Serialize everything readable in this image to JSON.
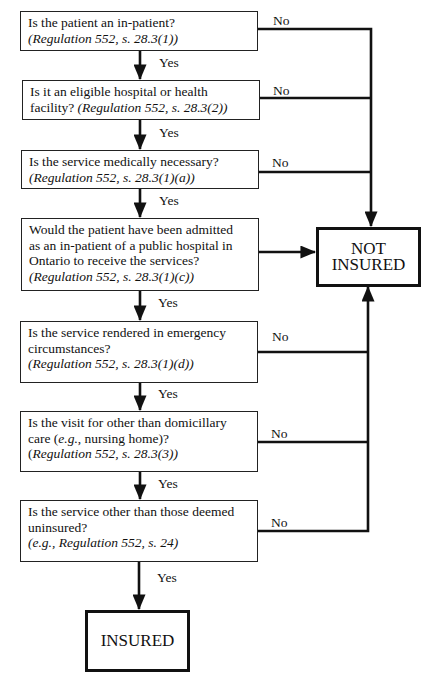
{
  "nodes": [
    {
      "id": "q1",
      "lines": [
        [
          {
            "text": "Is the patient an in-patient?",
            "italic": false
          }
        ],
        [
          {
            "text": "(Regulation 552, s. 28.3(1))",
            "italic": true
          }
        ]
      ]
    },
    {
      "id": "q2",
      "lines": [
        [
          {
            "text": "Is it an eligible hospital or health",
            "italic": false
          }
        ],
        [
          {
            "text": "facility? ",
            "italic": false
          },
          {
            "text": "(Regulation 552, s. 28.3(2))",
            "italic": true
          }
        ]
      ]
    },
    {
      "id": "q3",
      "lines": [
        [
          {
            "text": "Is the service medically necessary?",
            "italic": false
          }
        ],
        [
          {
            "text": "(Regulation 552, s. 28.3(1)(a))",
            "italic": true
          }
        ]
      ]
    },
    {
      "id": "q4",
      "lines": [
        [
          {
            "text": "Would the patient have been admitted",
            "italic": false
          }
        ],
        [
          {
            "text": "as an in-patient of a public hospital in",
            "italic": false
          }
        ],
        [
          {
            "text": "Ontario to receive the services?",
            "italic": false
          }
        ],
        [
          {
            "text": "(Regulation 552, s. 28.3(1)(c))",
            "italic": true
          }
        ]
      ]
    },
    {
      "id": "q5",
      "lines": [
        [
          {
            "text": "Is the service rendered in emergency",
            "italic": false
          }
        ],
        [
          {
            "text": "circumstances?",
            "italic": false
          }
        ],
        [
          {
            "text": "(Regulation 552, s. 28.3(1)(d))",
            "italic": true
          }
        ]
      ]
    },
    {
      "id": "q6",
      "lines": [
        [
          {
            "text": "Is the visit for other than domicillary",
            "italic": false
          }
        ],
        [
          {
            "text": "care (",
            "italic": false
          },
          {
            "text": "e.g.",
            "italic": true
          },
          {
            "text": ", nursing home)?",
            "italic": false
          }
        ],
        [
          {
            "text": "(",
            "italic": false
          },
          {
            "text": "Regulation 552, s. 28.3(3))",
            "italic": true
          }
        ]
      ]
    },
    {
      "id": "q7",
      "lines": [
        [
          {
            "text": "Is the service other than those deemed",
            "italic": false
          }
        ],
        [
          {
            "text": "uninsured?",
            "italic": false
          }
        ],
        [
          {
            "text": "(e.g., Regulation 552, s. 24)",
            "italic": true
          }
        ]
      ]
    }
  ],
  "outcomes": {
    "not_insured": {
      "line1": "NOT",
      "line2": "INSURED"
    },
    "insured": {
      "line1": "INSURED"
    }
  },
  "edge_labels": {
    "yes": "Yes",
    "no": "No"
  },
  "colors": {
    "stroke": "#111111",
    "background": "#ffffff"
  }
}
